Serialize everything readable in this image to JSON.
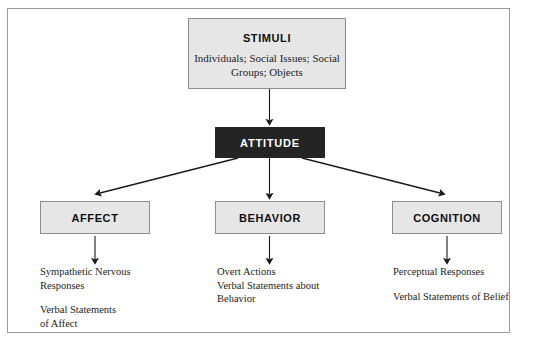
{
  "figure": {
    "title_box": {
      "heading": "STIMULI",
      "sub_line_1": "Individuals; Social Issues;",
      "sub_line_2": "Social Groups; Objects"
    },
    "attitude_box": {
      "label": "ATTITUDE"
    },
    "components": [
      {
        "label": "AFFECT",
        "responses": [
          [
            "Sympathetic Nervous",
            "Responses"
          ],
          [
            "Verbal Statements",
            "of Affect"
          ]
        ]
      },
      {
        "label": "BEHAVIOR",
        "responses": [
          [
            "Overt Actions",
            "Verbal Statements about",
            "Behavior"
          ]
        ]
      },
      {
        "label": "COGNITION",
        "responses": [
          [
            "Perceptual Responses"
          ],
          [
            "Verbal Statements of Belief"
          ]
        ]
      }
    ],
    "colors": {
      "box_fill": "#e6e6e6",
      "box_border": "#8d8d8d",
      "attitude_fill": "#242424",
      "attitude_text": "#ffffff",
      "arrow": "#1a1a1a",
      "frame_border": "#9a9a9a",
      "page_background": "#ffffff"
    }
  }
}
